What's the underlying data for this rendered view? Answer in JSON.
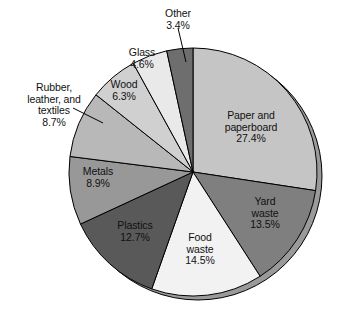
{
  "chart_data": {
    "type": "pie",
    "title": "",
    "subtitle": "",
    "xlabel": "",
    "ylabel": "",
    "legend_position": "none",
    "grid": false,
    "units": "percent",
    "start_angle_deg": 0,
    "direction": "clockwise",
    "categories": [
      "Paper and paperboard",
      "Yard waste",
      "Food waste",
      "Plastics",
      "Metals",
      "Rubber, leather, and textiles",
      "Wood",
      "Glass",
      "Other"
    ],
    "values": [
      27.4,
      13.5,
      14.5,
      12.7,
      8.9,
      8.7,
      6.3,
      4.6,
      3.4
    ],
    "slices": [
      {
        "key": "paper",
        "label_lines": [
          "Paper and",
          "paperboard"
        ],
        "value_text": "27.4%",
        "value": 27.4,
        "color": "#c5c5c5",
        "label_placement": "inside"
      },
      {
        "key": "yard",
        "label_lines": [
          "Yard",
          "waste"
        ],
        "value_text": "13.5%",
        "value": 13.5,
        "color": "#7f7f7f",
        "label_placement": "inside"
      },
      {
        "key": "food",
        "label_lines": [
          "Food",
          "waste"
        ],
        "value_text": "14.5%",
        "value": 14.5,
        "color": "#f2f2f2",
        "label_placement": "inside"
      },
      {
        "key": "plastics",
        "label_lines": [
          "Plastics"
        ],
        "value_text": "12.7%",
        "value": 12.7,
        "color": "#595959",
        "label_placement": "inside"
      },
      {
        "key": "metals",
        "label_lines": [
          "Metals"
        ],
        "value_text": "8.9%",
        "value": 8.9,
        "color": "#989898",
        "label_placement": "inside"
      },
      {
        "key": "rubber",
        "label_lines": [
          "Rubber,",
          "leather, and",
          "textiles"
        ],
        "value_text": "8.7%",
        "value": 8.7,
        "color": "#b8b8b8",
        "label_placement": "outside-leader"
      },
      {
        "key": "wood",
        "label_lines": [
          "Wood"
        ],
        "value_text": "6.3%",
        "value": 6.3,
        "color": "#d0d0d0",
        "label_placement": "inside"
      },
      {
        "key": "glass",
        "label_lines": [
          "Glass"
        ],
        "value_text": "4.6%",
        "value": 4.6,
        "color": "#e9e9e9",
        "label_placement": "inside"
      },
      {
        "key": "other",
        "label_lines": [
          "Other"
        ],
        "value_text": "3.4%",
        "value": 3.4,
        "color": "#6e6e6e",
        "label_placement": "outside-leader"
      }
    ]
  },
  "labels": {
    "paper": {
      "line1": "Paper and",
      "line2": "paperboard",
      "value": "27.4%"
    },
    "yard": {
      "line1": "Yard",
      "line2": "waste",
      "value": "13.5%"
    },
    "food": {
      "line1": "Food",
      "line2": "waste",
      "value": "14.5%"
    },
    "plastics": {
      "line1": "Plastics",
      "value": "12.7%"
    },
    "metals": {
      "line1": "Metals",
      "value": "8.9%"
    },
    "rubber": {
      "line1": "Rubber,",
      "line2": "leather, and",
      "line3": "textiles",
      "value": "8.7%"
    },
    "wood": {
      "line1": "Wood",
      "value": "6.3%"
    },
    "glass": {
      "line1": "Glass",
      "value": "4.6%"
    },
    "other": {
      "line1": "Other",
      "value": "3.4%"
    }
  },
  "geometry": {
    "cx": 193,
    "cy": 172,
    "r": 124,
    "depth_offset_x": 5,
    "depth_offset_y": 4
  },
  "colors": {
    "outline": "#000000",
    "background": "#ffffff",
    "shadow": "#9a9a9a",
    "text": "#111111"
  }
}
